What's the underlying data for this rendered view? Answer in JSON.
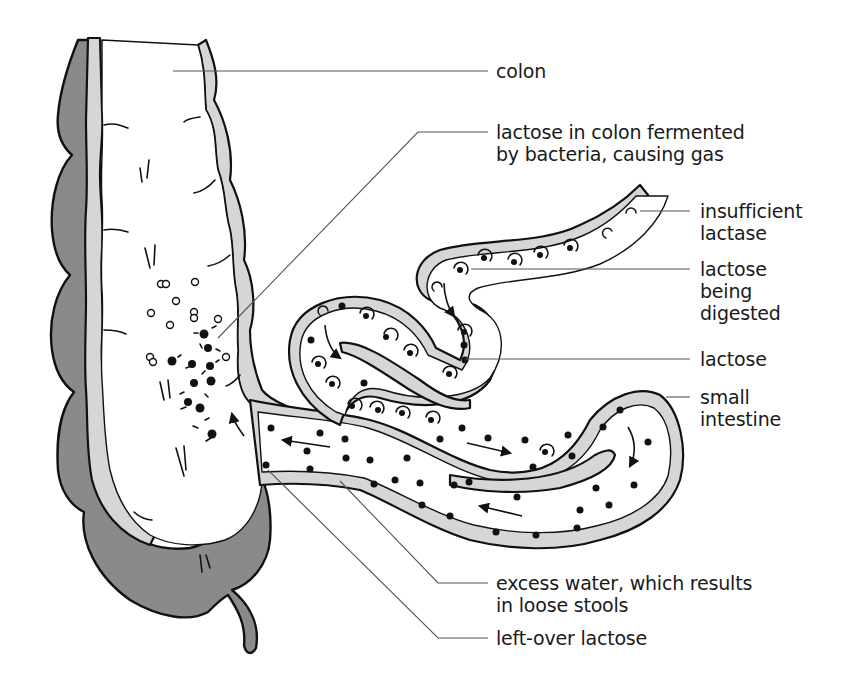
{
  "figure": {
    "type": "anatomical diagram",
    "colors": {
      "outer_wall": "#8a8a8a",
      "inner_lining": "#d6d6d6",
      "outline": "#111111",
      "leader_line": "#555555",
      "background": "#ffffff"
    }
  },
  "labels": {
    "colon": {
      "lines": [
        "colon"
      ]
    },
    "fermented": {
      "lines": [
        "lactose in colon fermented",
        "by bacteria, causing gas"
      ]
    },
    "insufficient_lactase": {
      "lines": [
        "insufficient",
        "lactase"
      ]
    },
    "being_digested": {
      "lines": [
        "lactose",
        "being",
        "digested"
      ]
    },
    "lactose": {
      "lines": [
        "lactose"
      ]
    },
    "small_intestine": {
      "lines": [
        "small",
        "intestine"
      ]
    },
    "excess_water": {
      "lines": [
        "excess water, which results",
        "in loose stools"
      ]
    },
    "leftover_lactose": {
      "lines": [
        "left-over lactose"
      ]
    }
  }
}
